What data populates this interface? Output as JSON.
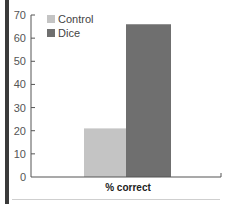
{
  "chart_data": {
    "type": "bar",
    "title": "",
    "categories": [
      "% correct"
    ],
    "series": [
      {
        "name": "Control",
        "values": [
          21
        ],
        "color": "#c4c4c4"
      },
      {
        "name": "Dice",
        "values": [
          66
        ],
        "color": "#6f6f6f"
      }
    ],
    "xlabel": "% correct",
    "ylabel": "",
    "ylim": [
      0,
      70
    ],
    "yticks": [
      0,
      10,
      20,
      30,
      40,
      50,
      60,
      70
    ],
    "grid": false,
    "legend_position": "top-left"
  },
  "legend": {
    "items": [
      {
        "label": "Control",
        "color": "#c4c4c4"
      },
      {
        "label": "Dice",
        "color": "#6f6f6f"
      }
    ]
  },
  "axis": {
    "x_label": "% correct",
    "y_ticks": [
      "0",
      "10",
      "20",
      "30",
      "40",
      "50",
      "60",
      "70"
    ]
  }
}
